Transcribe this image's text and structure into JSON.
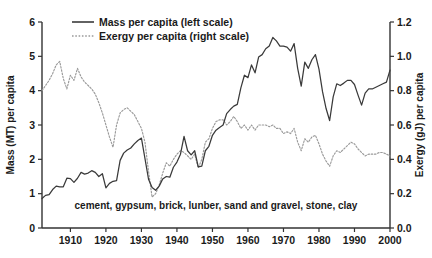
{
  "chart_data": {
    "type": "line",
    "title": "",
    "xlabel": "",
    "ylabel": "Mass (MT) per capita",
    "y2label": "Exergy (gJ) per capita",
    "xlim": [
      1902,
      2000
    ],
    "ylim": [
      0,
      6
    ],
    "y2lim": [
      0.0,
      1.2
    ],
    "grid": false,
    "legend_position": "top-left",
    "annotation": "cement, gypsum, brick, lunber, sand and gravel, stone, clay",
    "xticks": [
      1910,
      1920,
      1930,
      1940,
      1950,
      1960,
      1970,
      1980,
      1990,
      2000
    ],
    "xtick_labels": [
      "1910",
      "1920",
      "1930",
      "1940",
      "1950",
      "1960",
      "1970",
      "1980",
      "1990",
      "2000"
    ],
    "yticks": [
      0,
      1,
      2,
      3,
      4,
      5,
      6
    ],
    "ytick_labels": [
      "0",
      "1",
      "2",
      "3",
      "4",
      "5",
      "6"
    ],
    "y2ticks": [
      0.0,
      0.2,
      0.4,
      0.6,
      0.8,
      1.0,
      1.2
    ],
    "y2tick_labels": [
      "0.0",
      "0.2",
      "0.4",
      "0.6",
      "0.8",
      "1.0",
      "1.2"
    ],
    "series": [
      {
        "name": "Mass per capita (left scale)",
        "axis": "left",
        "style": "solid",
        "color": "#3a3a3a",
        "x": [
          1902,
          1903,
          1904,
          1905,
          1906,
          1907,
          1908,
          1909,
          1910,
          1911,
          1912,
          1913,
          1914,
          1915,
          1916,
          1917,
          1918,
          1919,
          1920,
          1921,
          1922,
          1923,
          1924,
          1925,
          1926,
          1927,
          1928,
          1929,
          1930,
          1931,
          1932,
          1933,
          1934,
          1935,
          1936,
          1937,
          1938,
          1939,
          1940,
          1941,
          1942,
          1943,
          1944,
          1945,
          1946,
          1947,
          1948,
          1949,
          1950,
          1951,
          1952,
          1953,
          1954,
          1955,
          1956,
          1957,
          1958,
          1959,
          1960,
          1961,
          1962,
          1963,
          1964,
          1965,
          1966,
          1967,
          1968,
          1969,
          1970,
          1971,
          1972,
          1973,
          1974,
          1975,
          1976,
          1977,
          1978,
          1979,
          1980,
          1981,
          1982,
          1983,
          1984,
          1985,
          1986,
          1987,
          1988,
          1989,
          1990,
          1991,
          1992,
          1993,
          1994,
          1995,
          1996,
          1997,
          1998,
          1999,
          2000
        ],
        "y": [
          0.86,
          0.95,
          0.97,
          1.12,
          1.22,
          1.2,
          1.2,
          1.45,
          1.44,
          1.33,
          1.45,
          1.62,
          1.57,
          1.6,
          1.67,
          1.62,
          1.5,
          1.58,
          1.17,
          1.3,
          1.36,
          1.38,
          1.97,
          2.18,
          2.27,
          2.33,
          2.45,
          2.55,
          2.62,
          2.02,
          1.42,
          1.18,
          1.1,
          1.22,
          1.43,
          1.5,
          1.48,
          1.77,
          1.92,
          2.15,
          2.67,
          2.25,
          2.13,
          2.25,
          1.78,
          1.8,
          2.25,
          2.38,
          2.7,
          2.85,
          2.93,
          3.0,
          3.33,
          3.45,
          3.55,
          3.6,
          4.08,
          4.45,
          4.38,
          4.75,
          4.52,
          4.98,
          5.05,
          5.22,
          5.3,
          5.55,
          5.45,
          5.3,
          5.3,
          5.27,
          5.15,
          5.37,
          4.65,
          4.13,
          4.83,
          4.65,
          4.9,
          5.05,
          4.63,
          3.97,
          3.48,
          3.13,
          3.82,
          4.2,
          4.15,
          4.22,
          4.3,
          4.3,
          4.18,
          3.87,
          3.58,
          3.93,
          4.05,
          4.05,
          4.1,
          4.15,
          4.2,
          4.25,
          4.6
        ]
      },
      {
        "name": "Exergy per capita (right scale)",
        "axis": "right",
        "style": "dotted",
        "color": "#9a9a9a",
        "x": [
          1902,
          1903,
          1904,
          1905,
          1906,
          1907,
          1908,
          1909,
          1910,
          1911,
          1912,
          1913,
          1914,
          1915,
          1916,
          1917,
          1918,
          1919,
          1920,
          1921,
          1922,
          1923,
          1924,
          1925,
          1926,
          1927,
          1928,
          1929,
          1930,
          1931,
          1932,
          1933,
          1934,
          1935,
          1936,
          1937,
          1938,
          1939,
          1940,
          1941,
          1942,
          1943,
          1944,
          1945,
          1946,
          1947,
          1948,
          1949,
          1950,
          1951,
          1952,
          1953,
          1954,
          1955,
          1956,
          1957,
          1958,
          1959,
          1960,
          1961,
          1962,
          1963,
          1964,
          1965,
          1966,
          1967,
          1968,
          1969,
          1970,
          1971,
          1972,
          1973,
          1974,
          1975,
          1976,
          1977,
          1978,
          1979,
          1980,
          1981,
          1982,
          1983,
          1984,
          1985,
          1986,
          1987,
          1988,
          1989,
          1990,
          1991,
          1992,
          1993,
          1994,
          1995,
          1996,
          1997,
          1998,
          1999,
          2000
        ],
        "y": [
          0.8,
          0.83,
          0.86,
          0.9,
          0.95,
          0.97,
          0.87,
          0.81,
          0.89,
          0.86,
          0.93,
          0.88,
          0.85,
          0.83,
          0.81,
          0.78,
          0.73,
          0.67,
          0.6,
          0.53,
          0.47,
          0.6,
          0.67,
          0.69,
          0.7,
          0.68,
          0.66,
          0.62,
          0.58,
          0.5,
          0.33,
          0.18,
          0.2,
          0.25,
          0.32,
          0.38,
          0.36,
          0.4,
          0.43,
          0.45,
          0.44,
          0.42,
          0.4,
          0.43,
          0.35,
          0.4,
          0.5,
          0.52,
          0.58,
          0.62,
          0.63,
          0.63,
          0.6,
          0.62,
          0.65,
          0.62,
          0.58,
          0.6,
          0.57,
          0.6,
          0.57,
          0.6,
          0.6,
          0.6,
          0.59,
          0.6,
          0.58,
          0.58,
          0.55,
          0.56,
          0.55,
          0.58,
          0.5,
          0.45,
          0.52,
          0.5,
          0.53,
          0.54,
          0.49,
          0.43,
          0.39,
          0.36,
          0.42,
          0.45,
          0.44,
          0.46,
          0.48,
          0.5,
          0.49,
          0.46,
          0.44,
          0.42,
          0.43,
          0.43,
          0.43,
          0.44,
          0.44,
          0.43,
          0.42
        ]
      }
    ]
  },
  "legend": {
    "items": [
      {
        "label": "Mass per capita (left scale)",
        "style": "solid"
      },
      {
        "label": "Exergy per capita (right scale)",
        "style": "dotted"
      }
    ]
  }
}
